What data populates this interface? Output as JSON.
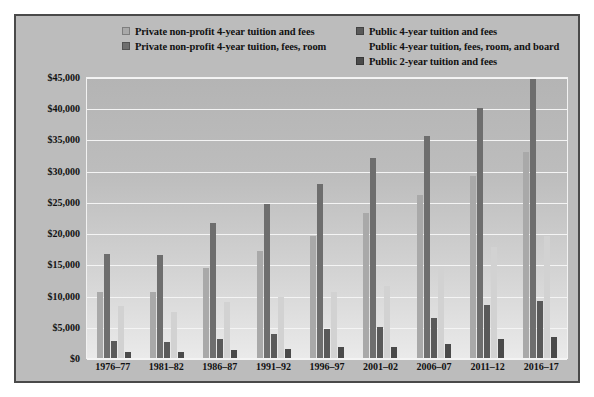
{
  "figure": {
    "background_color": "#bcbcbc",
    "border_color": "#4a4a4a"
  },
  "legend": {
    "position": "top",
    "columns": [
      {
        "name": "left-column",
        "entries": [
          {
            "label": "Private non-profit 4-year tuition and fees",
            "color": "#a9a9a9",
            "swatch": true
          },
          {
            "label": "Private non-profit 4-year tuition, fees, room",
            "color": "#6e6e6e",
            "swatch": true
          }
        ]
      },
      {
        "name": "right-column",
        "entries": [
          {
            "label": "Public 4-year tuition and fees",
            "color": "#595959",
            "swatch": true
          },
          {
            "label": "Public 4-year tuition, fees, room, and board",
            "color": "#d2d2d2",
            "swatch": false
          },
          {
            "label": "Public 2-year tuition and fees",
            "color": "#4a4a4a",
            "swatch": true
          }
        ]
      }
    ]
  },
  "chart_data": {
    "type": "bar",
    "title": "",
    "subtitle": "",
    "xlabel": "",
    "ylabel": "",
    "ylim": [
      0,
      45000
    ],
    "grid": true,
    "legend_position": "top",
    "categories": [
      "1976–77",
      "1981–82",
      "1986–87",
      "1991–92",
      "1996–97",
      "2001–02",
      "2006–07",
      "2011–12",
      "2016–17"
    ],
    "y_ticks": [
      "$0",
      "$5,000",
      "$10,000",
      "$15,000",
      "$20,000",
      "$25,000",
      "$30,000",
      "$35,000",
      "$40,000",
      "$45,000"
    ],
    "y_tick_values": [
      0,
      5000,
      10000,
      15000,
      20000,
      25000,
      30000,
      35000,
      40000,
      45000
    ],
    "series": [
      {
        "name": "Private non-profit 4-year tuition and fees",
        "color": "#a9a9a9",
        "values": [
          10500,
          10600,
          14400,
          17200,
          19600,
          23300,
          26100,
          29100,
          33000
        ]
      },
      {
        "name": "Private non-profit 4-year tuition, fees, room",
        "color": "#6e6e6e",
        "values": [
          16700,
          16500,
          21600,
          24700,
          27800,
          32000,
          35600,
          40000,
          44700
        ]
      },
      {
        "name": "Public 4-year tuition and fees",
        "color": "#595959",
        "values": [
          2700,
          2500,
          3100,
          3800,
          4600,
          5000,
          6400,
          8500,
          9200
        ]
      },
      {
        "name": "Public 4-year tuition, fees, room, and board",
        "color": "#d2d2d2",
        "values": [
          8300,
          7400,
          8900,
          9700,
          10500,
          11600,
          14700,
          17800,
          19500
        ]
      },
      {
        "name": "Public 2-year tuition and fees",
        "color": "#4a4a4a",
        "values": [
          1000,
          900,
          1300,
          1500,
          1700,
          1700,
          2300,
          3100,
          3300
        ]
      }
    ]
  }
}
